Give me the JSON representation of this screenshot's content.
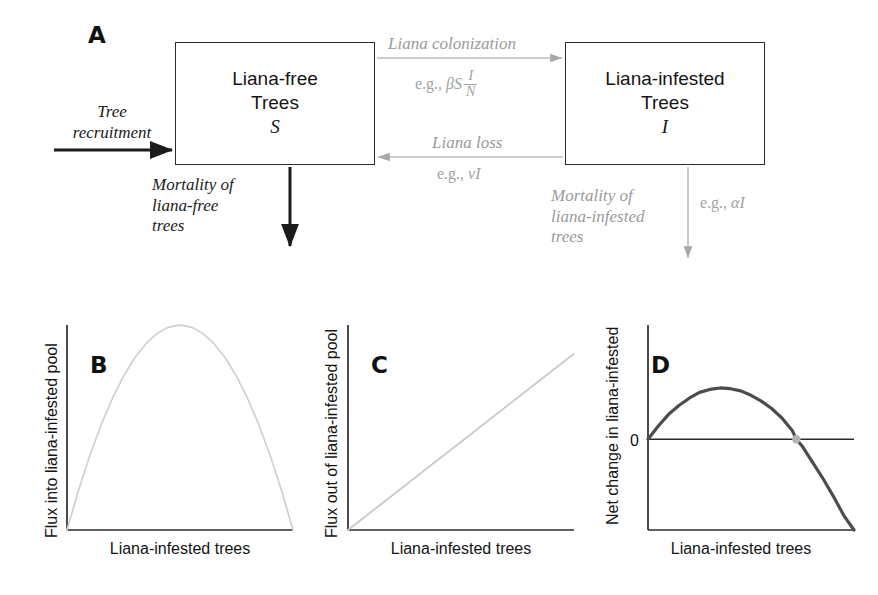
{
  "figure": {
    "panels": [
      "A",
      "B",
      "C",
      "D"
    ]
  },
  "panelA": {
    "letter": "A",
    "boxes": [
      {
        "name": "liana-free-trees",
        "line1": "Liana-free",
        "line2": "Trees",
        "symbol": "S"
      },
      {
        "name": "liana-infested-trees",
        "line1": "Liana-infested",
        "line2": "Trees",
        "symbol": "I"
      }
    ],
    "flows": [
      {
        "name": "tree-recruitment",
        "label_line1": "Tree",
        "label_line2": "recruitment",
        "color": "#1b1b1b"
      },
      {
        "name": "liana-colonization",
        "label": "Liana colonization",
        "equation_prefix": "e.g., ",
        "equation_body": "βS",
        "equation_numerator": "I",
        "equation_denominator": "N",
        "color": "#9a9a9a"
      },
      {
        "name": "liana-loss",
        "label": "Liana loss",
        "equation_prefix": "e.g., ",
        "equation_body": "νI",
        "color": "#9a9a9a"
      },
      {
        "name": "mortality-liana-free",
        "label_line1": "Mortality of",
        "label_line2": "liana-free",
        "label_line3": "trees",
        "color": "#1b1b1b"
      },
      {
        "name": "mortality-liana-infested",
        "label_line1": "Mortality of",
        "label_line2": "liana-infested",
        "label_line3": "trees",
        "equation_prefix": "e.g., ",
        "equation_body": "αI",
        "color": "#9a9a9a"
      }
    ]
  },
  "chart_data": [
    {
      "panel": "B",
      "type": "line",
      "title": "B",
      "xlabel": "Liana-infested trees",
      "ylabel": "Flux into liana-infested pool",
      "description": "Hump-shaped (unimodal) colonization flux curve, zero at both ends",
      "line_color": "#d2d2d2",
      "xlim": [
        0,
        1
      ],
      "ylim": [
        0,
        1
      ],
      "grid": false,
      "x": [
        0,
        0.05,
        0.1,
        0.15,
        0.2,
        0.25,
        0.3,
        0.35,
        0.4,
        0.45,
        0.5,
        0.55,
        0.6,
        0.65,
        0.7,
        0.75,
        0.8,
        0.85,
        0.9,
        0.95,
        1
      ],
      "y": [
        0,
        0.19,
        0.36,
        0.51,
        0.64,
        0.75,
        0.84,
        0.91,
        0.96,
        0.99,
        1,
        0.99,
        0.96,
        0.91,
        0.84,
        0.75,
        0.64,
        0.51,
        0.36,
        0.19,
        0
      ]
    },
    {
      "panel": "C",
      "type": "line",
      "title": "C",
      "xlabel": "Liana-infested trees",
      "ylabel": "Flux out of liana-infested pool",
      "description": "Linear loss flux increasing proportionally from the origin",
      "line_color": "#c9c9c9",
      "xlim": [
        0,
        1
      ],
      "ylim": [
        0,
        1
      ],
      "grid": false,
      "x": [
        0,
        1
      ],
      "y": [
        0,
        0.86
      ]
    },
    {
      "panel": "D",
      "type": "line",
      "title": "D",
      "xlabel": "Liana-infested trees",
      "ylabel": "Net change in liana-infested",
      "description": "Net change curve: rises above zero, peaks, then crosses zero and becomes negative; equilibrium marked by a gray dot",
      "line_color": "#4c4c4c",
      "zero_line_label": "0",
      "zero_line_value": 0,
      "equilibrium_marker_color": "#b4b4b4",
      "equilibrium_x": 0.72,
      "xlim": [
        0,
        1
      ],
      "ylim": [
        -0.62,
        0.78
      ],
      "grid": false,
      "x": [
        0,
        0.05,
        0.1,
        0.15,
        0.2,
        0.25,
        0.3,
        0.35,
        0.4,
        0.45,
        0.5,
        0.55,
        0.6,
        0.65,
        0.7,
        0.72,
        0.75,
        0.8,
        0.85,
        0.9,
        0.95,
        1
      ],
      "y": [
        0,
        0.09,
        0.17,
        0.23,
        0.28,
        0.32,
        0.34,
        0.35,
        0.345,
        0.33,
        0.3,
        0.26,
        0.21,
        0.145,
        0.06,
        0.0,
        -0.05,
        -0.16,
        -0.27,
        -0.39,
        -0.52,
        -0.62
      ]
    }
  ]
}
